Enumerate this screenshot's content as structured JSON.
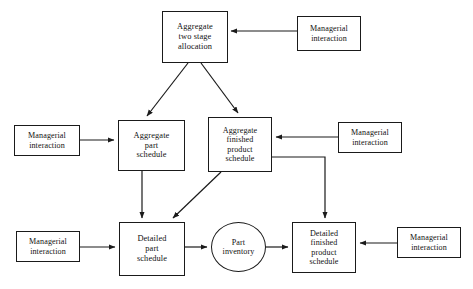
{
  "diagram": {
    "background_color": "#ffffff",
    "line_color": "#1a1a1a",
    "nodes": [
      {
        "id": "aggregate-two-stage-allocation",
        "name": "aggregate-two-stage-allocation-node",
        "label": "Aggregate\ntwo stage\nallocation",
        "shape": "box",
        "x": 162,
        "y": 11,
        "w": 66,
        "h": 52
      },
      {
        "id": "managerial-interaction-top",
        "name": "managerial-interaction-top-node",
        "label": "Managerial\ninteraction",
        "shape": "box",
        "x": 297,
        "y": 16,
        "w": 64,
        "h": 35
      },
      {
        "id": "managerial-interaction-left-mid",
        "name": "managerial-interaction-left-mid-node",
        "label": "Managerial\ninteraction",
        "shape": "box",
        "x": 14,
        "y": 125,
        "w": 66,
        "h": 31
      },
      {
        "id": "aggregate-part-schedule",
        "name": "aggregate-part-schedule-node",
        "label": "Aggregate\npart\nschedule",
        "shape": "box",
        "x": 118,
        "y": 120,
        "w": 67,
        "h": 51
      },
      {
        "id": "aggregate-finished-product-schedule",
        "name": "aggregate-finished-product-schedule-node",
        "label": "Aggregate\nfinished\nproduct\nschedule",
        "shape": "box",
        "x": 208,
        "y": 117,
        "w": 64,
        "h": 55
      },
      {
        "id": "managerial-interaction-right-mid",
        "name": "managerial-interaction-right-mid-node",
        "label": "Managerial\ninteraction",
        "shape": "box",
        "x": 338,
        "y": 122,
        "w": 64,
        "h": 31
      },
      {
        "id": "managerial-interaction-left-bottom",
        "name": "managerial-interaction-left-bottom-node",
        "label": "Managerial\ninteraction",
        "shape": "box",
        "x": 16,
        "y": 231,
        "w": 64,
        "h": 31
      },
      {
        "id": "detailed-part-schedule",
        "name": "detailed-part-schedule-node",
        "label": "Detailed\npart\nschedule",
        "shape": "box",
        "x": 119,
        "y": 222,
        "w": 66,
        "h": 54
      },
      {
        "id": "part-inventory",
        "name": "part-inventory-node",
        "label": "Part\ninventory",
        "shape": "ellipse",
        "x": 211,
        "y": 222,
        "w": 55,
        "h": 50
      },
      {
        "id": "detailed-finished-product-schedule",
        "name": "detailed-finished-product-schedule-node",
        "label": "Detailed\nfinished\nproduct\nschedule",
        "shape": "box",
        "x": 292,
        "y": 222,
        "w": 64,
        "h": 51
      },
      {
        "id": "managerial-interaction-right-bottom",
        "name": "managerial-interaction-right-bottom-node",
        "label": "Managerial\ninteraction",
        "shape": "box",
        "x": 397,
        "y": 227,
        "w": 64,
        "h": 31
      }
    ],
    "edges": [
      {
        "id": "edge-mgmt-top-to-allocation",
        "name": "edge-managerial-top-to-aggregate-two-stage-allocation",
        "from": "managerial-interaction-top",
        "to": "aggregate-two-stage-allocation",
        "points": "297,31 231,31"
      },
      {
        "id": "edge-allocation-to-aggregate-part",
        "name": "edge-aggregate-two-stage-allocation-to-aggregate-part-schedule",
        "from": "aggregate-two-stage-allocation",
        "to": "aggregate-part-schedule",
        "points": "188,63 147,116"
      },
      {
        "id": "edge-allocation-to-aggregate-finished",
        "name": "edge-aggregate-two-stage-allocation-to-aggregate-finished-product-schedule",
        "from": "aggregate-two-stage-allocation",
        "to": "aggregate-finished-product-schedule",
        "points": "201,63 238,113"
      },
      {
        "id": "edge-mgmt-left-mid-to-aggregate-part",
        "name": "edge-managerial-left-mid-to-aggregate-part-schedule",
        "from": "managerial-interaction-left-mid",
        "to": "aggregate-part-schedule",
        "points": "80,140 114,140"
      },
      {
        "id": "edge-mgmt-right-mid-to-aggregate-finished",
        "name": "edge-managerial-right-mid-to-aggregate-finished-product-schedule",
        "from": "managerial-interaction-right-mid",
        "to": "aggregate-finished-product-schedule",
        "points": "338,137 276,137"
      },
      {
        "id": "edge-aggregate-part-to-detailed-part",
        "name": "edge-aggregate-part-schedule-to-detailed-part-schedule",
        "from": "aggregate-part-schedule",
        "to": "detailed-part-schedule",
        "points": "142,171 142,218"
      },
      {
        "id": "edge-aggregate-finished-to-detailed-part",
        "name": "edge-aggregate-finished-product-schedule-to-detailed-part-schedule",
        "from": "aggregate-finished-product-schedule",
        "to": "detailed-part-schedule",
        "points": "221,172 173,218"
      },
      {
        "id": "edge-aggregate-finished-to-detailed-finished",
        "name": "edge-aggregate-finished-product-schedule-to-detailed-finished-product-schedule",
        "from": "aggregate-finished-product-schedule",
        "to": "detailed-finished-product-schedule",
        "points": "272,157 325,157 325,218"
      },
      {
        "id": "edge-mgmt-left-bottom-to-detailed-part",
        "name": "edge-managerial-left-bottom-to-detailed-part-schedule",
        "from": "managerial-interaction-left-bottom",
        "to": "detailed-part-schedule",
        "points": "80,247 115,247"
      },
      {
        "id": "edge-detailed-part-to-part-inventory",
        "name": "edge-detailed-part-schedule-to-part-inventory",
        "from": "detailed-part-schedule",
        "to": "part-inventory",
        "points": "185,247 207,247"
      },
      {
        "id": "edge-part-inventory-to-detailed-finished",
        "name": "edge-part-inventory-to-detailed-finished-product-schedule",
        "from": "part-inventory",
        "to": "detailed-finished-product-schedule",
        "points": "266,247 288,247"
      },
      {
        "id": "edge-mgmt-right-bottom-to-detailed-finished",
        "name": "edge-managerial-right-bottom-to-detailed-finished-product-schedule",
        "from": "managerial-interaction-right-bottom",
        "to": "detailed-finished-product-schedule",
        "points": "397,243 360,243"
      }
    ]
  }
}
